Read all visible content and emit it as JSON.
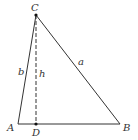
{
  "diagram": {
    "type": "triangle-with-altitude",
    "colors": {
      "stroke": "#333333",
      "background": "#ffffff"
    },
    "vertices": {
      "A": {
        "label": "A",
        "x": 18,
        "y": 124
      },
      "B": {
        "label": "B",
        "x": 120,
        "y": 124
      },
      "C": {
        "label": "C",
        "x": 36,
        "y": 15
      },
      "D": {
        "label": "D",
        "x": 36,
        "y": 124
      }
    },
    "sides": {
      "a": {
        "label": "a",
        "from": "C",
        "to": "B"
      },
      "b": {
        "label": "b",
        "from": "A",
        "to": "C"
      },
      "h": {
        "label": "h",
        "from": "C",
        "to": "D",
        "style": "dashed"
      }
    },
    "labels": {
      "C": "C",
      "A": "A",
      "D": "D",
      "B": "B",
      "a": "a",
      "b": "b",
      "h": "h"
    }
  }
}
